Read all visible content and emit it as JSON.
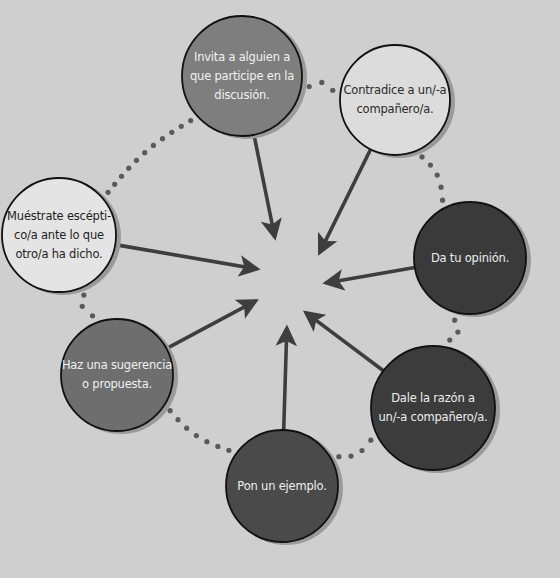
{
  "diagram": {
    "type": "radial-arrows-to-center",
    "background_color": "#cfcfcf",
    "arrow_color": "#3e3e3e",
    "dot_color": "#5a5a5a",
    "center": {
      "x": 295,
      "y": 275
    },
    "nodes": [
      {
        "id": "invite",
        "text": "Invita a alguien a\nque participe en la\ndiscusión.",
        "cx": 242,
        "cy": 76,
        "r": 60,
        "fill": "#7e7e7e",
        "text_color": "#f2f2f2",
        "arrow_tip": {
          "x": 276,
          "y": 243
        }
      },
      {
        "id": "contradict",
        "text": "Contradice a un/-a\ncompañero/a.",
        "cx": 395,
        "cy": 100,
        "r": 55,
        "fill": "#dcdcdc",
        "text_color": "#2a2a2a",
        "arrow_tip": {
          "x": 317,
          "y": 258
        }
      },
      {
        "id": "opinion",
        "text": "Da tu opinión.",
        "cx": 470,
        "cy": 258,
        "r": 56,
        "fill": "#3a3a3a",
        "text_color": "#eeeeee",
        "arrow_tip": {
          "x": 320,
          "y": 284
        }
      },
      {
        "id": "agree",
        "text": "Dale la razón a\nun/-a compañero/a.",
        "cx": 433,
        "cy": 408,
        "r": 62,
        "fill": "#3c3c3c",
        "text_color": "#eeeeee",
        "arrow_tip": {
          "x": 301,
          "y": 309
        }
      },
      {
        "id": "example",
        "text": "Pon un ejemplo.",
        "cx": 282,
        "cy": 486,
        "r": 56,
        "fill": "#4a4a4a",
        "text_color": "#eeeeee",
        "arrow_tip": {
          "x": 287,
          "y": 322
        }
      },
      {
        "id": "suggest",
        "text": "Haz una sugerencia\no propuesta.",
        "cx": 117,
        "cy": 375,
        "r": 56,
        "fill": "#6e6e6e",
        "text_color": "#f0f0f0",
        "arrow_tip": {
          "x": 261,
          "y": 298
        }
      },
      {
        "id": "skeptic",
        "text": "Muéstrate escépti-\nco/a ante lo que\notro/a ha dicho.",
        "cx": 59,
        "cy": 235,
        "r": 57,
        "fill": "#e4e4e4",
        "text_color": "#1e1e1e",
        "arrow_tip": {
          "x": 263,
          "y": 270
        }
      }
    ]
  }
}
